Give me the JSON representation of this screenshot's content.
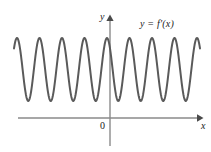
{
  "figure": {
    "background_color": "#ffffff",
    "width": 211,
    "height": 152
  },
  "labels": {
    "y_axis": "y",
    "x_axis": "x",
    "origin": "0",
    "curve": "y = f'(x)"
  },
  "colors": {
    "curve": "#5a5a5a",
    "axis": "#8a8a8a",
    "text": "#1a1a1a"
  },
  "chart_data": {
    "type": "line",
    "title": "",
    "subtitle": "",
    "xlabel": "x",
    "ylabel": "y",
    "legend": [
      "y = f'(x)"
    ],
    "legend_position": "top-right",
    "grid": false,
    "annotations": [
      "0"
    ],
    "axes": {
      "x_axis_pixel_y": 118,
      "y_axis_pixel_x": 110,
      "x_axis_arrow": true,
      "y_axis_arrow": true,
      "x_axis_start_pixel": 18,
      "x_axis_end_pixel": 202,
      "y_axis_top_pixel": 16,
      "y_axis_bottom_pixel": 146,
      "tick_labels_x": [],
      "tick_labels_y": []
    },
    "curve": {
      "name": "y = f'(x)",
      "shape": "sinusoid",
      "amplitude_pixels": 31.5,
      "center_pixel_y": 69.5,
      "peak_pixel_y": 38,
      "trough_pixel_y": 101,
      "period_pixels": 22.5,
      "peak_offset_pixels": 17,
      "x_start_pixel": 14,
      "x_end_pixel": 200,
      "cycles_visible": 8.5,
      "stroke_width": 2.0,
      "peaks_pixel_x": [
        17,
        39.5,
        62,
        84.5,
        107,
        129.5,
        152,
        174.5,
        197
      ],
      "troughs_pixel_x": [
        28.2,
        50.7,
        73.2,
        95.7,
        118.2,
        140.7,
        163.2,
        185.7
      ]
    }
  }
}
